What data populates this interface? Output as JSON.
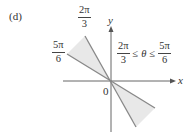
{
  "figure": {
    "panel_label": "(d)",
    "axes": {
      "x_label": "x",
      "y_label": "y",
      "origin_label": "0"
    },
    "rays": [
      {
        "angle_label": {
          "num": "2π",
          "den": "3"
        },
        "angle": "2π/3"
      },
      {
        "angle_label": {
          "num": "5π",
          "den": "6"
        },
        "angle": "5π/6"
      }
    ],
    "region_condition": {
      "left": {
        "num": "2π",
        "den": "3"
      },
      "op1": "≤",
      "var": "θ",
      "op2": "≤",
      "right": {
        "num": "5π",
        "den": "6"
      }
    },
    "colors": {
      "shade": "#e8e8e8",
      "lines": "#888888",
      "axes": "#666666"
    }
  }
}
